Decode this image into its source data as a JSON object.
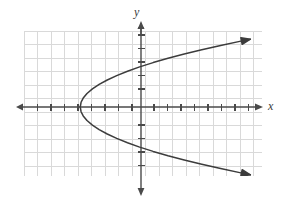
{
  "figure": {
    "background_color": "#ffffff",
    "width": 286,
    "height": 203
  },
  "axis_labels": {
    "x": "x",
    "y": "y"
  },
  "chart_data": {
    "type": "line",
    "title": "",
    "subtitle": "",
    "xlabel": "x",
    "ylabel": "y",
    "grid": true,
    "grid_color": "#d9d9d9",
    "grid_step": 1,
    "axis_color": "#4a4a4a",
    "curve_color": "#3c3c3c",
    "legend": null,
    "legend_position": "none",
    "xlim": [
      -8.7,
      9.0
    ],
    "ylim": [
      -5.6,
      5.6
    ],
    "xticks": [
      -8,
      -7,
      -6,
      -5,
      -4,
      -3,
      -2,
      -1,
      1,
      2,
      3,
      4,
      5,
      6,
      7,
      8
    ],
    "yticks": [
      -5,
      -4,
      -3,
      -2,
      -1,
      1,
      2,
      3,
      4,
      5
    ],
    "xticklabels": [],
    "yticklabels": [],
    "annotations": [],
    "series": [
      {
        "name": "parabola-upper-branch",
        "description": "Upper half of a rightward-opening parabola x = 0.5*y^2 - 4.5, from the vertex to an arrowhead at the upper right.",
        "arrow_end": true,
        "x": [
          -4.5,
          -4.44,
          -4.28,
          -4.0,
          -3.6,
          -3.1,
          -2.5,
          -1.8,
          -1.0,
          -0.1,
          0.9,
          2.0,
          3.2,
          4.5,
          5.9,
          7.4,
          8.1
        ],
        "y": [
          0.0,
          0.35,
          0.66,
          1.0,
          1.34,
          1.67,
          2.0,
          2.32,
          2.65,
          2.97,
          3.29,
          3.61,
          3.92,
          4.24,
          4.56,
          4.88,
          5.02
        ]
      },
      {
        "name": "parabola-lower-branch",
        "description": "Lower half of a rightward-opening parabola x = 0.5*y^2 - 4.5, from the vertex to an arrowhead at the lower right.",
        "arrow_end": true,
        "x": [
          -4.5,
          -4.44,
          -4.28,
          -4.0,
          -3.6,
          -3.1,
          -2.5,
          -1.8,
          -1.0,
          -0.1,
          0.9,
          2.0,
          3.2,
          4.5,
          5.9,
          7.4,
          8.1
        ],
        "y": [
          0.0,
          -0.35,
          -0.66,
          -1.0,
          -1.34,
          -1.67,
          -2.0,
          -2.32,
          -2.65,
          -2.97,
          -3.29,
          -3.61,
          -3.92,
          -4.24,
          -4.56,
          -4.88,
          -5.02
        ]
      }
    ],
    "vertex": [
      -4.5,
      0
    ],
    "equation": "x = 0.5*y^2 - 4.5",
    "x_intercepts": [
      -4.5
    ],
    "y_intercepts": [
      -3,
      3
    ]
  }
}
